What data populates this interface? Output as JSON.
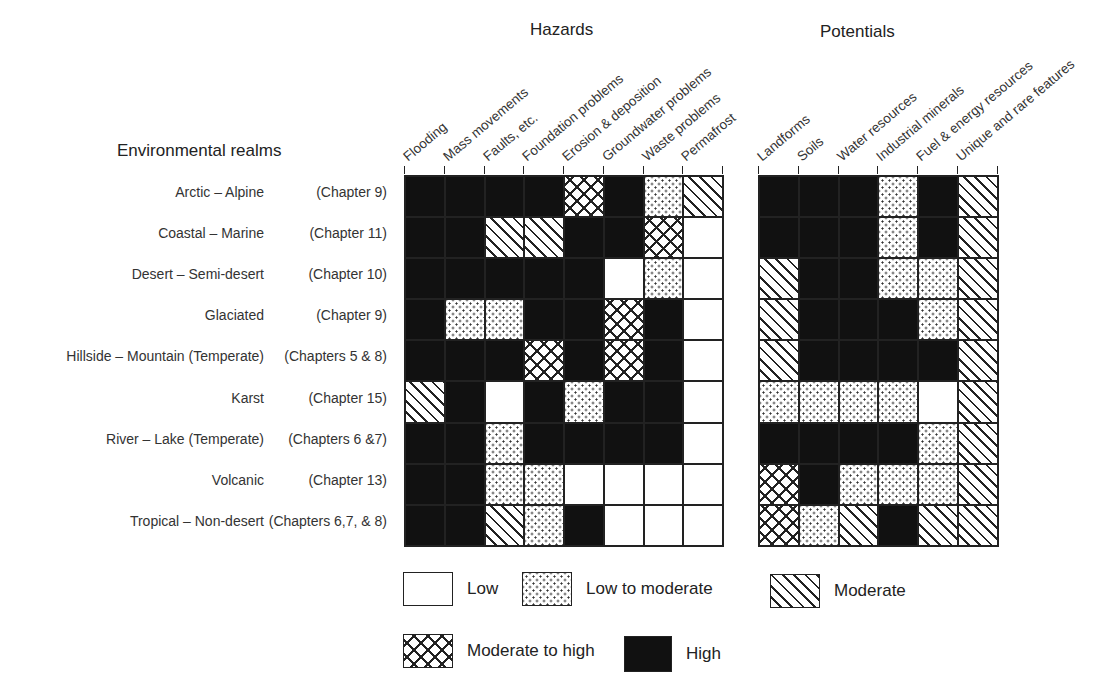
{
  "chart_data": {
    "type": "heatmap",
    "row_header": "Environmental realms",
    "levels": {
      "L": "Low",
      "LM": "Low to moderate",
      "M": "Moderate",
      "MH": "Moderate to high",
      "H": "High"
    },
    "rows": [
      {
        "realm": "Arctic – Alpine",
        "chapter": "(Chapter 9)"
      },
      {
        "realm": "Coastal – Marine",
        "chapter": "(Chapter 11)"
      },
      {
        "realm": "Desert – Semi-desert",
        "chapter": "(Chapter 10)"
      },
      {
        "realm": "Glaciated",
        "chapter": "(Chapter 9)"
      },
      {
        "realm": "Hillside – Mountain (Temperate)",
        "chapter": "(Chapters 5 & 8)"
      },
      {
        "realm": "Karst",
        "chapter": "(Chapter 15)"
      },
      {
        "realm": "River – Lake (Temperate)",
        "chapter": "(Chapters 6 &7)"
      },
      {
        "realm": "Volcanic",
        "chapter": "(Chapter 13)"
      },
      {
        "realm": "Tropical – Non-desert",
        "chapter": "(Chapters 6,7, & 8)"
      }
    ],
    "groups": [
      {
        "name": "Hazards",
        "columns": [
          "Flooding",
          "Mass movements",
          "Faults, etc.",
          "Foundation problems",
          "Erosion & deposition",
          "Groundwater problems",
          "Waste problems",
          "Permafrost"
        ],
        "values": [
          [
            "H",
            "H",
            "H",
            "H",
            "MH",
            "H",
            "LM",
            "M"
          ],
          [
            "H",
            "H",
            "M",
            "M",
            "H",
            "H",
            "MH",
            "L"
          ],
          [
            "H",
            "H",
            "H",
            "H",
            "H",
            "L",
            "LM",
            "L"
          ],
          [
            "H",
            "LM",
            "LM",
            "H",
            "H",
            "MH",
            "H",
            "L"
          ],
          [
            "H",
            "H",
            "H",
            "MH",
            "H",
            "MH",
            "H",
            "L"
          ],
          [
            "M",
            "H",
            "L",
            "H",
            "LM",
            "H",
            "H",
            "L"
          ],
          [
            "H",
            "H",
            "LM",
            "H",
            "H",
            "H",
            "H",
            "L"
          ],
          [
            "H",
            "H",
            "LM",
            "LM",
            "L",
            "L",
            "L",
            "L"
          ],
          [
            "H",
            "H",
            "M",
            "LM",
            "H",
            "L",
            "L",
            "L"
          ]
        ]
      },
      {
        "name": "Potentials",
        "columns": [
          "Landforms",
          "Soils",
          "Water resources",
          "Industrial minerals",
          "Fuel & energy resources",
          "Unique and rare features"
        ],
        "values": [
          [
            "H",
            "H",
            "H",
            "LM",
            "H",
            "M"
          ],
          [
            "H",
            "H",
            "H",
            "LM",
            "H",
            "M"
          ],
          [
            "M",
            "H",
            "H",
            "LM",
            "LM",
            "M"
          ],
          [
            "M",
            "H",
            "H",
            "H",
            "LM",
            "M"
          ],
          [
            "M",
            "H",
            "H",
            "H",
            "H",
            "M"
          ],
          [
            "LM",
            "LM",
            "LM",
            "LM",
            "L",
            "M"
          ],
          [
            "H",
            "H",
            "H",
            "H",
            "LM",
            "M"
          ],
          [
            "MH",
            "H",
            "LM",
            "LM",
            "LM",
            "M"
          ],
          [
            "MH",
            "LM",
            "M",
            "H",
            "M",
            "M"
          ]
        ]
      }
    ],
    "legend": [
      {
        "key": "L",
        "label": "Low"
      },
      {
        "key": "LM",
        "label": "Low to moderate"
      },
      {
        "key": "M",
        "label": "Moderate"
      },
      {
        "key": "MH",
        "label": "Moderate to high"
      },
      {
        "key": "H",
        "label": "High"
      }
    ]
  }
}
